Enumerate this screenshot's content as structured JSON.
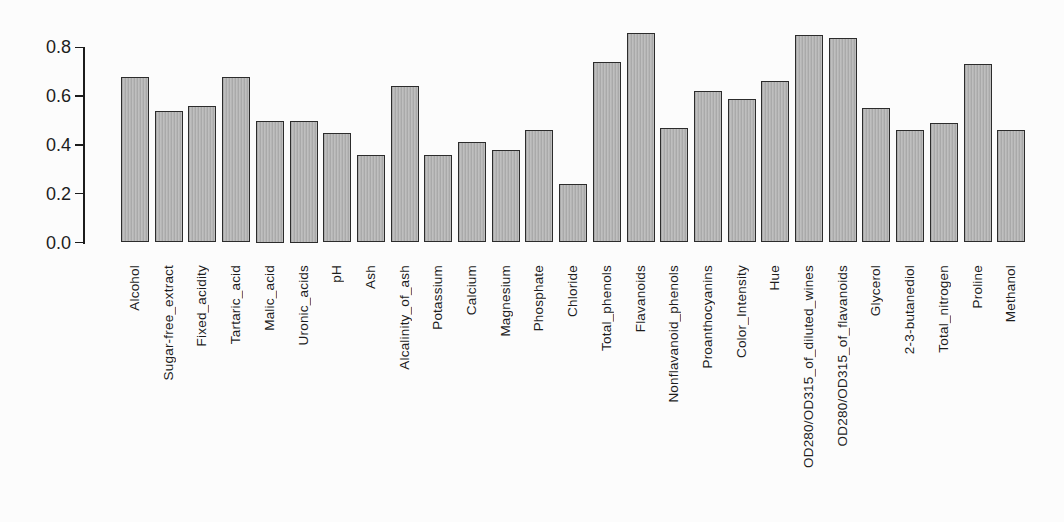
{
  "chart_data": {
    "type": "bar",
    "title": "",
    "xlabel": "",
    "ylabel": "",
    "categories": [
      "Alcohol",
      "Sugar-free_extract",
      "Fixed_acidity",
      "Tartaric_acid",
      "Malic_acid",
      "Uronic_acids",
      "pH",
      "Ash",
      "Alcalinity_of_ash",
      "Potassium",
      "Calcium",
      "Magnesium",
      "Phosphate",
      "Chloride",
      "Total_phenols",
      "Flavanoids",
      "Nonflavanoid_phenols",
      "Proanthocyanins",
      "Color_Intensity",
      "Hue",
      "OD280/OD315_of_diluted_wines",
      "OD280/OD315_of_flavanoids",
      "Glycerol",
      "2-3-butanediol",
      "Total_nitrogen",
      "Proline",
      "Methanol"
    ],
    "values": [
      0.68,
      0.54,
      0.56,
      0.68,
      0.5,
      0.5,
      0.45,
      0.36,
      0.64,
      0.36,
      0.41,
      0.38,
      0.46,
      0.24,
      0.74,
      0.86,
      0.47,
      0.62,
      0.59,
      0.66,
      0.85,
      0.84,
      0.55,
      0.46,
      0.49,
      0.73,
      0.46
    ],
    "yticks": [
      0.0,
      0.2,
      0.4,
      0.6,
      0.8
    ],
    "ytick_labels": [
      "0.0",
      "0.2",
      "0.4",
      "0.6",
      "0.8"
    ],
    "ylim": [
      0,
      0.88
    ],
    "grid": false,
    "legend_position": "none",
    "bar_fill_color": "#b6b6b6",
    "bar_border_color": "#2c2c2c",
    "axis_color": "#1c1c1c",
    "background_color": "#fcfcfc"
  }
}
